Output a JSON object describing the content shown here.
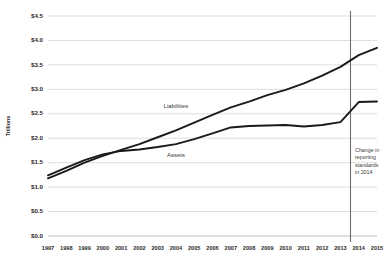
{
  "chart_data": {
    "type": "line",
    "title": "",
    "xlabel": "",
    "ylabel": "Trillions",
    "grid": true,
    "legend_position": "inline-labels",
    "x": [
      1997,
      1998,
      1999,
      2000,
      2001,
      2002,
      2003,
      2004,
      2005,
      2006,
      2007,
      2008,
      2009,
      2010,
      2011,
      2012,
      2013,
      2014,
      2015
    ],
    "categories": [
      "1997",
      "1998",
      "1999",
      "2000",
      "2001",
      "2002",
      "2003",
      "2004",
      "2005",
      "2006",
      "2007",
      "2008",
      "2009",
      "2010",
      "2011",
      "2012",
      "2013",
      "2014",
      "2015"
    ],
    "xlim": [
      1997,
      2015
    ],
    "ylim": [
      0.0,
      4.5
    ],
    "ytick_values": [
      0.0,
      0.5,
      1.0,
      1.5,
      2.0,
      2.5,
      3.0,
      3.5,
      4.0,
      4.5
    ],
    "ytick_labels": [
      "$0.0",
      "$0.5",
      "$1.0",
      "$1.5",
      "$2.0",
      "$2.5",
      "$3.0",
      "$3.5",
      "$4.0",
      "$4.5"
    ],
    "series": [
      {
        "name": "Liabilities",
        "color": "#1a1a1a",
        "label_x": 2004,
        "label_y": 2.62,
        "values": [
          1.18,
          1.33,
          1.5,
          1.64,
          1.76,
          1.88,
          2.02,
          2.16,
          2.32,
          2.48,
          2.63,
          2.75,
          2.88,
          2.99,
          3.12,
          3.28,
          3.46,
          3.7,
          3.85
        ]
      },
      {
        "name": "Assets",
        "color": "#1a1a1a",
        "label_x": 2004,
        "label_y": 1.62,
        "values": [
          1.24,
          1.4,
          1.55,
          1.67,
          1.74,
          1.77,
          1.82,
          1.88,
          1.98,
          2.1,
          2.22,
          2.25,
          2.26,
          2.27,
          2.24,
          2.27,
          2.33,
          2.74,
          2.75
        ]
      }
    ],
    "annotations": [
      {
        "name": "reporting-standards-change",
        "type": "vertical-line",
        "x": 2013.55,
        "lines": [
          "Change in",
          "reporting",
          "standards",
          "in 2014"
        ],
        "text_x": 2013.8,
        "text_y": 1.72
      }
    ]
  }
}
